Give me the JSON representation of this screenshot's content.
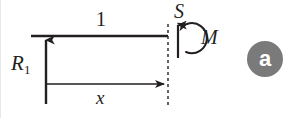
{
  "figure": {
    "kind": "free-body-diagram",
    "caption_badge": "a",
    "background_color": "#ffffff",
    "ink_color": "#231f20",
    "badge_color": "#7a7a7a",
    "badge_text_color": "#ffffff"
  },
  "labels": {
    "span_length": "1",
    "reaction_force": "R",
    "reaction_force_subscript": "1",
    "shear_force": "S",
    "moment": "M",
    "distance": "x"
  },
  "geometry": {
    "beam": {
      "x1": 31,
      "y1": 36,
      "x2": 168,
      "y2": 36,
      "stroke_width": 2.6
    },
    "reaction_arrow": {
      "x": 46,
      "y_tail": 104,
      "y_head": 38,
      "direction": "up",
      "stroke_width": 2.4
    },
    "cut_line": {
      "x": 168,
      "y_top": 24,
      "y_bottom": 106,
      "dash": "3 3",
      "stroke_width": 1.4
    },
    "shear_arrow": {
      "x": 178,
      "y_tail": 58,
      "y_head": 22,
      "direction": "up",
      "stroke_width": 2.2
    },
    "moment_arc": {
      "center_x": 186,
      "center_y": 37,
      "radius": 15,
      "direction": "counterclockwise-open-left",
      "stroke_width": 2.0
    },
    "distance_arrow": {
      "x_tail": 46,
      "x_head": 167,
      "y": 84,
      "direction": "right",
      "stroke_width": 1.6
    },
    "badge": {
      "center_x": 265,
      "center_y": 59,
      "diameter": 36
    }
  }
}
